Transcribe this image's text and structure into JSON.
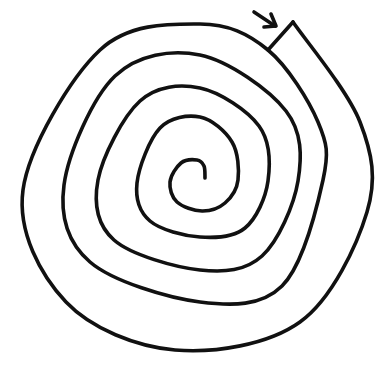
{
  "colors": {
    "background": "#ffffff",
    "ink": "#111111"
  },
  "entrance_arrow": {
    "label": "entrance-arrow",
    "shaft": [
      [
        254,
        12
      ],
      [
        275,
        26
      ]
    ],
    "head": [
      [
        271,
        14
      ],
      [
        276,
        26
      ],
      [
        264,
        27
      ]
    ]
  },
  "spiral": {
    "points": [
      [
        205,
        178
      ],
      [
        204,
        166
      ],
      [
        197,
        160
      ],
      [
        181,
        163
      ],
      [
        170,
        182
      ],
      [
        177,
        202
      ],
      [
        202,
        211
      ],
      [
        225,
        203
      ],
      [
        238,
        180
      ],
      [
        232,
        142
      ],
      [
        200,
        117
      ],
      [
        160,
        128
      ],
      [
        137,
        183
      ],
      [
        150,
        221
      ],
      [
        200,
        237
      ],
      [
        245,
        228
      ],
      [
        268,
        181
      ],
      [
        259,
        126
      ],
      [
        200,
        88
      ],
      [
        140,
        101
      ],
      [
        98,
        180
      ],
      [
        114,
        240
      ],
      [
        200,
        270
      ],
      [
        262,
        256
      ],
      [
        298,
        181
      ],
      [
        286,
        111
      ],
      [
        200,
        55
      ],
      [
        115,
        76
      ],
      [
        64,
        185
      ],
      [
        90,
        262
      ],
      [
        200,
        302
      ],
      [
        282,
        286
      ],
      [
        323,
        180
      ],
      [
        318,
        122
      ],
      [
        268,
        50
      ],
      [
        200,
        24
      ],
      [
        100,
        50
      ],
      [
        23,
        190
      ],
      [
        66,
        302
      ],
      [
        175,
        350
      ],
      [
        300,
        322
      ],
      [
        367,
        212
      ],
      [
        360,
        122
      ],
      [
        293,
        22
      ]
    ],
    "notch": [
      [
        293,
        22
      ],
      [
        268,
        50
      ]
    ]
  }
}
